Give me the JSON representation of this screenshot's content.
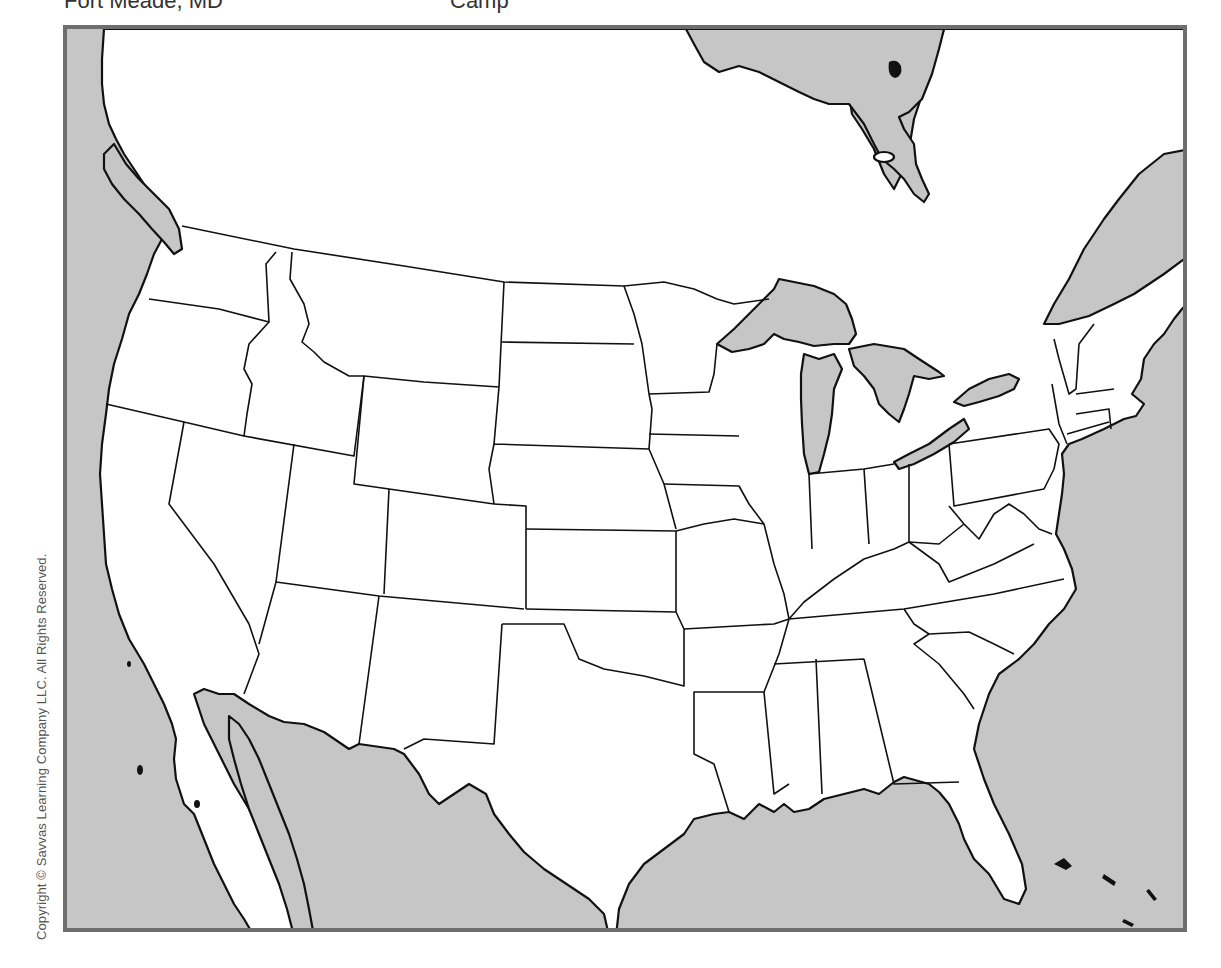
{
  "header": {
    "items": [
      {
        "label": "Fort Meade, MD",
        "x": 64
      },
      {
        "label": "Camp",
        "x": 450
      },
      {
        "label": "",
        "x": 700
      }
    ]
  },
  "copyright": "Copyright © Savvas Learning Company LLC. All Rights Reserved.",
  "map": {
    "title": "Outline map of the United States (contiguous 48 states)",
    "type": "blank outline map",
    "land_color": "#ffffff",
    "water_color": "#c6c6c6",
    "frame_color": "#6e6e6e",
    "labels": [],
    "features": [
      "contiguous-us-state-boundaries",
      "great-lakes",
      "gulf-of-mexico",
      "atlantic-ocean",
      "pacific-ocean",
      "baja-california",
      "gulf-of-california",
      "florida-inset-top",
      "st-lawrence-river",
      "bahamas"
    ]
  }
}
